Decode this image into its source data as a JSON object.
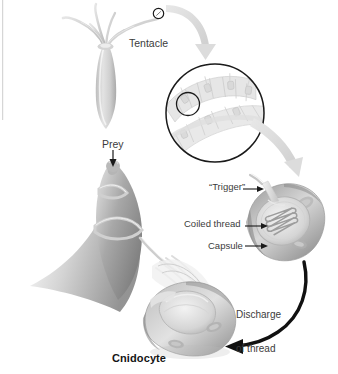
{
  "figure": {
    "title": "Cnidocyte",
    "background_color": "#ffffff",
    "ink_color": "#3b3b3b",
    "caption_color": "#141414",
    "tissue_light": "#e9e9e9",
    "tissue_mid": "#c8c8c8",
    "tissue_dark": "#8f8f8f",
    "arrow_gray": "#dcdcdc",
    "arrow_black": "#111111"
  },
  "labels": {
    "tentacle": "Tentacle",
    "prey": "Prey",
    "trigger": "“Trigger”",
    "coiled_thread": "Coiled thread",
    "capsule": "Capsule",
    "discharge_line1": "Discharge",
    "discharge_line2": "of thread",
    "cnidocyte": "Cnidocyte"
  },
  "parts": {
    "hydra": "hydra-polyp",
    "tentacle_marker": "tentacle-tip-circle-marker",
    "magnifier": "magnified-tentacle-epithelium-circle",
    "magnifier_inner": "single-cnidocyte-highlight-circle",
    "cnidocyte_loaded": "undischarged-cnidocyte",
    "cnidocyte_fired": "discharged-cnidocyte",
    "prey_body": "prey-organism",
    "thread": "everted-nematocyst-thread"
  },
  "arrows": {
    "zoom_1": "gray-arrow-tentacle-to-magnifier",
    "zoom_2": "gray-arrow-magnifier-to-cnidocyte",
    "discharge": "black-arrow-discharge-of-thread",
    "prey_pointer": "black-arrow-prey",
    "leader_trigger": "leader-line-trigger",
    "leader_coiled": "leader-line-coiled-thread",
    "leader_capsule": "leader-line-capsule"
  }
}
